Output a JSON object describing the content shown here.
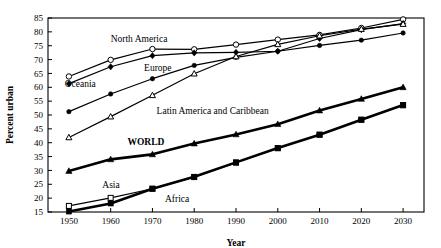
{
  "chart_data": {
    "type": "line",
    "title": "",
    "xlabel": "Year",
    "ylabel": "Percent urban",
    "x": [
      1950,
      1960,
      1970,
      1980,
      1990,
      2000,
      2010,
      2020,
      2030
    ],
    "xticklabels": [
      "1950",
      "1960",
      "1970",
      "1980",
      "1990",
      "2000",
      "2010",
      "2020",
      "2030"
    ],
    "yticklabels": [
      "15",
      "20",
      "25",
      "30",
      "35",
      "40",
      "45",
      "50",
      "55",
      "60",
      "65",
      "70",
      "75",
      "80",
      "85"
    ],
    "xlim": [
      1945,
      2035
    ],
    "ylim": [
      15,
      85
    ],
    "ytick_step": 5,
    "grid": false,
    "legend": "inline-labels",
    "series": [
      {
        "name": "North America",
        "marker": "open-circle",
        "linewidth": 1.2,
        "label_x": 1960,
        "label_y": 76.5,
        "values": [
          63.9,
          69.9,
          73.8,
          73.7,
          75.4,
          77.2,
          78.9,
          81.4,
          84.5
        ]
      },
      {
        "name": "Oceania",
        "marker": "filled-diamond",
        "linewidth": 1.2,
        "label_x": 1949,
        "label_y": 60.0,
        "values": [
          61.3,
          67.4,
          71.4,
          72.4,
          72.6,
          73.0,
          77.6,
          80.8,
          83.0
        ]
      },
      {
        "name": "Europe",
        "marker": "filled-circle",
        "linewidth": 1.2,
        "label_x": 1968,
        "label_y": 66.0,
        "values": [
          51.2,
          57.6,
          63.1,
          67.9,
          70.8,
          73.0,
          75.1,
          77.0,
          79.6
        ]
      },
      {
        "name": "Latin America and Caribbean",
        "marker": "open-triangle",
        "linewidth": 1.2,
        "label_x": 1971,
        "label_y": 50.5,
        "values": [
          41.9,
          49.4,
          57.1,
          64.9,
          71.1,
          75.5,
          78.6,
          81.0,
          82.8
        ]
      },
      {
        "name": "WORLD",
        "marker": "filled-triangle",
        "linewidth": 2.6,
        "label_x": 1964,
        "label_y": 39.0,
        "values": [
          29.8,
          34.0,
          35.8,
          39.7,
          43.0,
          46.7,
          51.6,
          55.8,
          60.0
        ]
      },
      {
        "name": "Asia",
        "marker": "open-square",
        "linewidth": 1.2,
        "label_x": 1958,
        "label_y": 23.5,
        "values": [
          17.2,
          20.1,
          23.4,
          27.6,
          32.8,
          38.0,
          42.9,
          48.3,
          53.5
        ]
      },
      {
        "name": "Africa",
        "marker": "filled-square",
        "linewidth": 2.6,
        "label_x": 1973,
        "label_y": 18.5,
        "values": [
          15.2,
          18.1,
          23.4,
          27.7,
          32.9,
          38.1,
          42.9,
          48.3,
          53.6
        ]
      }
    ]
  }
}
